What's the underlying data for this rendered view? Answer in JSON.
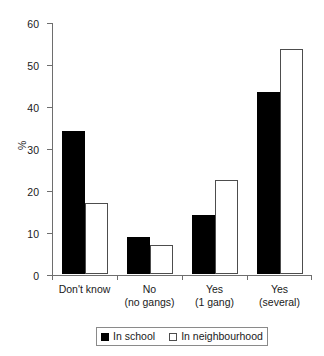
{
  "chart_data": {
    "type": "bar",
    "title": "",
    "xlabel": "",
    "ylabel": "%",
    "ylim": [
      0,
      60
    ],
    "yticks": [
      0,
      10,
      20,
      30,
      40,
      50,
      60
    ],
    "grid": false,
    "legend_position": "bottom",
    "categories": [
      "Don't know",
      "No\n(no gangs)",
      "Yes\n(1 gang)",
      "Yes\n(several)"
    ],
    "category_lines": [
      {
        "line1": "Don't know",
        "line2": ""
      },
      {
        "line1": "No",
        "line2": "(no gangs)"
      },
      {
        "line1": "Yes",
        "line2": "(1 gang)"
      },
      {
        "line1": "Yes",
        "line2": "(several)"
      }
    ],
    "series": [
      {
        "name": "In school",
        "color": "#000000",
        "values": [
          34,
          8.8,
          14,
          43.3
        ]
      },
      {
        "name": "In neighbourhood",
        "color": "#ffffff",
        "values": [
          17,
          6.9,
          22.5,
          53.5
        ]
      }
    ]
  },
  "axis": {
    "y_tick_labels": [
      "0",
      "10",
      "20",
      "30",
      "40",
      "50",
      "60"
    ],
    "y_title": "%"
  },
  "legend": {
    "items": [
      {
        "label": "In school",
        "swatch": "filled-square"
      },
      {
        "label": "In neighbourhood",
        "swatch": "open-square"
      }
    ]
  }
}
